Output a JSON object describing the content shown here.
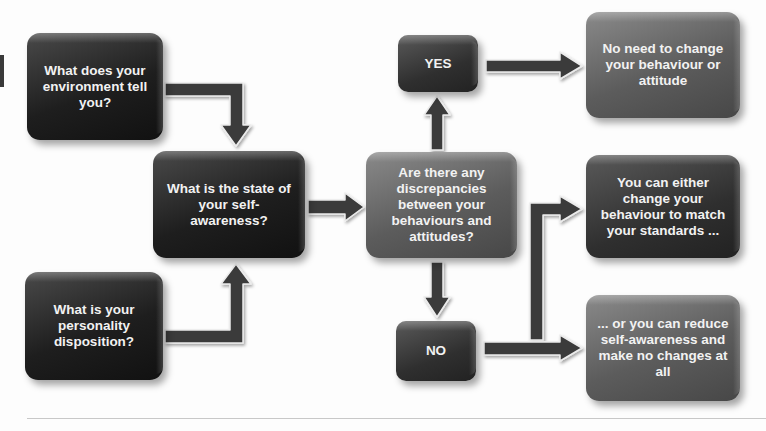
{
  "diagram": {
    "type": "flowchart",
    "nodes": {
      "environment": {
        "label": "What does your environment tell you?"
      },
      "disposition": {
        "label": "What is your personality disposition?"
      },
      "self_awareness": {
        "label": "What is the state of your self-awareness?"
      },
      "discrepancies": {
        "label": "Are there any discrepancies between your behaviours and attitudes?"
      },
      "yes": {
        "label": "YES"
      },
      "no": {
        "label": "NO"
      },
      "no_change": {
        "label": "No need to change your behaviour or attitude"
      },
      "change_behaviour": {
        "label": "You can either change your behaviour to match your standards ..."
      },
      "reduce_awareness": {
        "label": "... or you can reduce self-awareness and make no changes at all"
      }
    },
    "edges": [
      {
        "from": "environment",
        "to": "self_awareness"
      },
      {
        "from": "disposition",
        "to": "self_awareness"
      },
      {
        "from": "self_awareness",
        "to": "discrepancies"
      },
      {
        "from": "discrepancies",
        "to": "yes"
      },
      {
        "from": "discrepancies",
        "to": "no"
      },
      {
        "from": "yes",
        "to": "no_change"
      },
      {
        "from": "no",
        "to": "change_behaviour"
      },
      {
        "from": "no",
        "to": "reduce_awareness"
      }
    ],
    "colors": {
      "dark_box": "#1e1e1e",
      "gray_box": "#5c5c5c",
      "arrow": "#3a3a3a",
      "arrow_outline": "#e8e8e8",
      "background": "#fdfdfd"
    }
  }
}
